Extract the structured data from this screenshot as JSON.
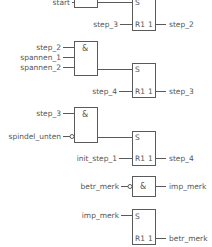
{
  "diagram": {
    "type": "function-block-diagram",
    "networks": [
      {
        "gate": {
          "symbol": "",
          "inputs": [
            "start"
          ]
        },
        "flipflop": {
          "set_label": "S",
          "reset_label": "R1",
          "out_label": "1",
          "reset_input": "step_3",
          "output": "step_2"
        }
      },
      {
        "gate": {
          "symbol": "&",
          "inputs": [
            "step_2",
            "spannen_1",
            "spannen_2"
          ]
        },
        "flipflop": {
          "set_label": "S",
          "reset_label": "R1",
          "out_label": "1",
          "reset_input": "step_4",
          "output": "step_3"
        }
      },
      {
        "gate": {
          "symbol": "&",
          "inputs": [
            "step_3",
            "spindel_unten"
          ],
          "negated_inputs": [
            "spindel_unten"
          ]
        },
        "flipflop": {
          "set_label": "S",
          "reset_label": "R1",
          "out_label": "1",
          "reset_input": "init_step_1",
          "output": "step_4"
        }
      },
      {
        "gate": {
          "symbol": "&",
          "inputs": [
            "betr_merk"
          ],
          "negated_inputs": [
            "betr_merk"
          ],
          "output": "imp_merk"
        }
      },
      {
        "flipflop": {
          "set_label": "S",
          "reset_label": "R1",
          "out_label": "1",
          "set_input": "imp_merk",
          "output": "betr_merk"
        }
      }
    ]
  }
}
